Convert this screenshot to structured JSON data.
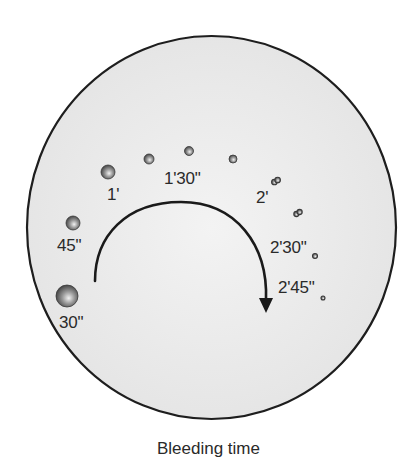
{
  "diagram": {
    "title": "Bleeding time",
    "colors": {
      "plate_fill": "#e9e9e9",
      "plate_stroke": "#1e1e1e",
      "arrow": "#1a1a1a",
      "text": "#2a2a2a",
      "drop_highlight": "#f2f2f2",
      "drop_mid": "#9a9a9a",
      "drop_rim": "#3a3a3a"
    },
    "plate": {
      "cx": 211.5,
      "cy": 227.5,
      "rx": 184.5,
      "ry": 191.5,
      "shape": "filter-paper-circle"
    },
    "arrow": {
      "direction": "clockwise",
      "start": [
        95,
        281
      ],
      "apex": [
        181,
        202
      ],
      "end": [
        266,
        300
      ],
      "head_tip": [
        266,
        313
      ]
    },
    "drops": [
      {
        "time": "30\"",
        "cx": 67,
        "cy": 296,
        "r": 11
      },
      {
        "time": "45\"",
        "cx": 73,
        "cy": 223,
        "r": 7
      },
      {
        "time": "1'",
        "cx": 108,
        "cy": 172,
        "r": 7
      },
      {
        "time": "1'15\"",
        "cx": 149,
        "cy": 159,
        "r": 5
      },
      {
        "time": "1'30\"",
        "cx": 189,
        "cy": 151,
        "r": 4.5
      },
      {
        "time": "1'45\"",
        "cx": 233,
        "cy": 159,
        "r": 4
      },
      {
        "time": "2'",
        "cx": 276,
        "cy": 181,
        "r": 2.8,
        "paired": true
      },
      {
        "time": "2'15\"",
        "cx": 298,
        "cy": 213,
        "r": 2.6,
        "paired": true
      },
      {
        "time": "2'30\"",
        "cx": 315,
        "cy": 256,
        "r": 2.5
      },
      {
        "time": "2'45\"",
        "cx": 323,
        "cy": 298,
        "r": 2
      }
    ],
    "labels": [
      {
        "text": "30\"",
        "x": 59,
        "y": 314
      },
      {
        "text": "45\"",
        "x": 57,
        "y": 237
      },
      {
        "text": "1'",
        "x": 107,
        "y": 186
      },
      {
        "text": "1'30\"",
        "x": 164,
        "y": 170
      },
      {
        "text": "2'",
        "x": 256,
        "y": 189
      },
      {
        "text": "2'30\"",
        "x": 270,
        "y": 239
      },
      {
        "text": "2'45\"",
        "x": 278,
        "y": 279
      }
    ]
  }
}
